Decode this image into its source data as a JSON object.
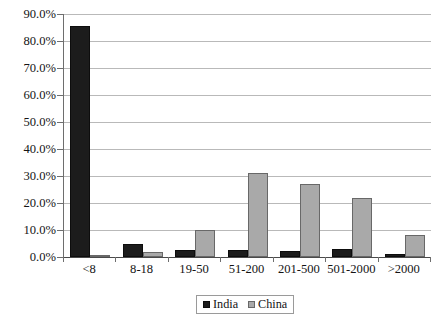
{
  "chart_data": {
    "type": "bar",
    "title": "",
    "subtitle": "",
    "xlabel": "",
    "ylabel": "",
    "categories": [
      "<8",
      "8-18",
      "19-50",
      "51-200",
      "201-500",
      "501-2000",
      ">2000"
    ],
    "series": [
      {
        "name": "India",
        "color": "#1c1c1c",
        "values": [
          85.5,
          5.0,
          2.5,
          2.5,
          2.2,
          2.8,
          1.0
        ]
      },
      {
        "name": "China",
        "color": "#a9a9a9",
        "values": [
          0.7,
          2.0,
          10.0,
          31.0,
          27.2,
          22.0,
          8.0
        ]
      }
    ],
    "ylim": [
      0,
      90
    ],
    "ytick_values": [
      0,
      10,
      20,
      30,
      40,
      50,
      60,
      70,
      80,
      90
    ],
    "ytick_labels": [
      "0.0%",
      "10.0%",
      "20.0%",
      "30.0%",
      "40.0%",
      "50.0%",
      "60.0%",
      "70.0%",
      "80.0%",
      "90.0%"
    ],
    "grid": true,
    "legend_position": "bottom",
    "legend_entries": [
      "India",
      "China"
    ]
  }
}
